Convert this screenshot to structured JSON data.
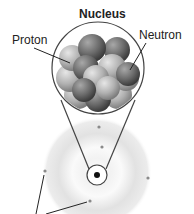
{
  "diagram": {
    "title": "Nucleus",
    "labels": {
      "proton": "Proton",
      "neutron": "Neutron"
    },
    "components": {
      "nucleus_magnified": "cluster of protons and neutrons inside circular magnifier",
      "atom": "electron cloud with central nucleus",
      "electrons_count": 5,
      "unlabeled_pointer_lines": 2
    },
    "colors": {
      "outline": "#444444",
      "cloud": "#e4e4e4",
      "proton": "#b5b5b5",
      "neutron": "#6e6e6e",
      "nucleus_dot": "#111111",
      "electron": "#8a8a8a"
    }
  }
}
